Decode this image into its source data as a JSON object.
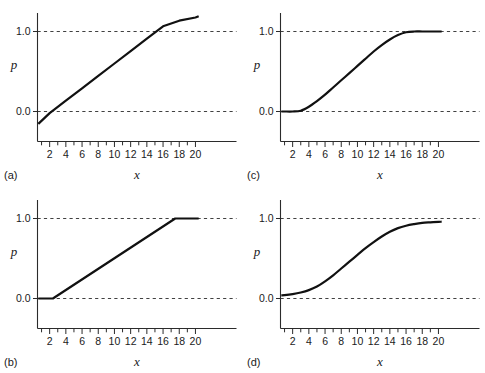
{
  "figure": {
    "panel_count": 4,
    "background": "#ffffff",
    "line_color": "#111111",
    "grid_color": "#2b2b2b"
  },
  "axes": {
    "xlabel": "x",
    "ylabel": "p",
    "x_ticks_all": [
      1,
      2,
      3,
      4,
      5,
      6,
      7,
      8,
      9,
      10,
      11,
      12,
      13,
      14,
      15,
      16,
      17,
      18,
      19,
      20
    ],
    "x_ticklabels": [
      "2",
      "4",
      "6",
      "8",
      "10",
      "12",
      "14",
      "16",
      "18",
      "20"
    ],
    "x_ticklabel_values": [
      2,
      4,
      6,
      8,
      10,
      12,
      14,
      16,
      18,
      20
    ],
    "y_ticklabels": [
      "0.0",
      "1.0"
    ],
    "y_ticklabel_values": [
      0.0,
      1.0
    ],
    "xlim": [
      0.4,
      20.6
    ],
    "ylim": [
      -0.28,
      1.3
    ],
    "grid": "dashed horizontal reference lines at p = 0.0 and p = 1.0"
  },
  "panels": [
    {
      "key": "a",
      "label": "(a)",
      "position": "top-left"
    },
    {
      "key": "c",
      "label": "(c)",
      "position": "top-right"
    },
    {
      "key": "b",
      "label": "(b)",
      "position": "bottom-left"
    },
    {
      "key": "d",
      "label": "(d)",
      "position": "bottom-right"
    }
  ],
  "chart_data": [
    {
      "type": "line",
      "panel": "(a)",
      "title": "",
      "xlabel": "x",
      "ylabel": "p",
      "xlim": [
        0.4,
        20.6
      ],
      "ylim": [
        -0.28,
        1.3
      ],
      "grid": true,
      "gridlines_y": [
        0.0,
        1.0
      ],
      "description": "Unbounded straight line; crosses p=0 near x=2.2 and p=1 near x=17.6, exceeding 1 at the right edge",
      "series": [
        {
          "name": "linear probability",
          "x": [
            0.6,
            2,
            4,
            6,
            8,
            10,
            12,
            14,
            16,
            18,
            20,
            20.4
          ],
          "values": [
            -0.155,
            -0.02,
            0.135,
            0.29,
            0.445,
            0.6,
            0.755,
            0.91,
            1.065,
            1.135,
            1.175,
            1.19
          ]
        }
      ]
    },
    {
      "type": "line",
      "panel": "(c)",
      "title": "",
      "xlabel": "x",
      "ylabel": "p",
      "xlim": [
        0.4,
        20.6
      ],
      "ylim": [
        -0.28,
        1.3
      ],
      "grid": true,
      "gridlines_y": [
        0.0,
        1.0
      ],
      "description": "Smooth S-shaped curve pinned at p=0 for small x and saturating exactly at p=1 near x=17",
      "series": [
        {
          "name": "smoothed bounded curve",
          "x": [
            0.6,
            1,
            2,
            3,
            4,
            5,
            6,
            7,
            8,
            9,
            10,
            11,
            12,
            13,
            14,
            15,
            16,
            17,
            18,
            19,
            20,
            20.4
          ],
          "values": [
            0.0,
            0.0,
            0.0,
            0.01,
            0.06,
            0.13,
            0.21,
            0.3,
            0.39,
            0.48,
            0.57,
            0.66,
            0.75,
            0.83,
            0.9,
            0.955,
            0.99,
            1.0,
            1.0,
            1.0,
            1.0,
            1.0
          ]
        }
      ]
    },
    {
      "type": "line",
      "panel": "(b)",
      "title": "",
      "xlabel": "x",
      "ylabel": "p",
      "xlim": [
        0.4,
        20.6
      ],
      "ylim": [
        -0.28,
        1.3
      ],
      "grid": true,
      "gridlines_y": [
        0.0,
        1.0
      ],
      "description": "Piecewise-linear clipped line: flat at p=0 until x=2.4, linear rise, flat at p=1 from x=17.5",
      "series": [
        {
          "name": "truncated linear probability",
          "x": [
            0.6,
            2.4,
            17.5,
            20.4
          ],
          "values": [
            0.0,
            0.0,
            1.0,
            1.0
          ]
        }
      ]
    },
    {
      "type": "line",
      "panel": "(d)",
      "title": "",
      "xlabel": "x",
      "ylabel": "p",
      "xlim": [
        0.4,
        20.6
      ],
      "ylim": [
        -0.28,
        1.3
      ],
      "grid": true,
      "gridlines_y": [
        0.0,
        1.0
      ],
      "description": "Logistic curve asymptotic to 0 and 1; never reaches either bound, midpoint near x=10.5",
      "series": [
        {
          "name": "logistic probability",
          "x": [
            0.6,
            1,
            2,
            3,
            4,
            5,
            6,
            7,
            8,
            9,
            10,
            11,
            12,
            13,
            14,
            15,
            16,
            17,
            18,
            19,
            20,
            20.4
          ],
          "values": [
            0.04,
            0.042,
            0.055,
            0.075,
            0.105,
            0.15,
            0.215,
            0.29,
            0.375,
            0.46,
            0.545,
            0.63,
            0.705,
            0.775,
            0.835,
            0.88,
            0.91,
            0.93,
            0.945,
            0.952,
            0.958,
            0.96
          ]
        }
      ]
    }
  ]
}
